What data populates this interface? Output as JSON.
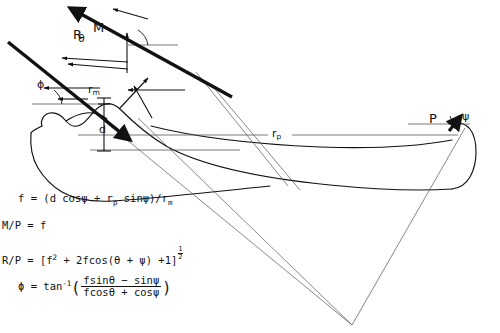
{
  "figure": {
    "background_color": "#ffffff",
    "ink_color": "#111111",
    "thin_line_color": "#555555"
  },
  "vectors": [
    {
      "name": "R",
      "label": "R",
      "description": "joint reaction force vector, bold arrow pointing down-right"
    },
    {
      "name": "M",
      "label": "M",
      "description": "muscle force vector, bold arrow pointing up-left"
    },
    {
      "name": "P",
      "label": "P",
      "description": "applied load vector at distal end, bold arrow pointing up-right"
    }
  ],
  "angles": [
    {
      "name": "theta",
      "label": "θ",
      "description": "angle between M vector and horizontal reference line"
    },
    {
      "name": "phi",
      "label": "ϕ",
      "description": "angle between R vector and horizontal reference line"
    },
    {
      "name": "psi",
      "label": "ψ",
      "description": "angle between P vector and horizontal reference line"
    }
  ],
  "dimensions": [
    {
      "name": "r_m",
      "label": "r",
      "subscript": "m",
      "description": "muscle moment arm"
    },
    {
      "name": "r_p",
      "label": "r",
      "subscript": "p",
      "description": "load moment arm measured along shaft"
    },
    {
      "name": "d",
      "label": "d",
      "subscript": "",
      "description": "perpendicular offset distance at joint centre"
    }
  ],
  "equations": {
    "eq1": {
      "lhs": "f",
      "eq": "=",
      "rhs_open": "(d cos",
      "psi1": "ψ",
      "plus": "+",
      "r_p_base": "r",
      "r_p_sub": "p",
      "sin": "sin",
      "psi2": "ψ",
      "close": ")/r",
      "r_m_sub": "m"
    },
    "eq2": {
      "lhs": "M/P",
      "eq": "=",
      "rhs": "f"
    },
    "eq3": {
      "lhs": "R/P",
      "eq": "=",
      "open": "[f",
      "sup2": "2",
      "mid": "+ 2fcos(",
      "theta": "θ",
      "plus": "+",
      "psi": "ψ",
      "tail": ") +1]",
      "exp_num": "1",
      "exp_den": "2"
    },
    "eq4": {
      "lhs": "ϕ",
      "eq": "=",
      "fn": "tan",
      "fn_sup": "-1",
      "num": "fsinθ − sinψ",
      "den": "fcosθ + cosψ"
    }
  }
}
